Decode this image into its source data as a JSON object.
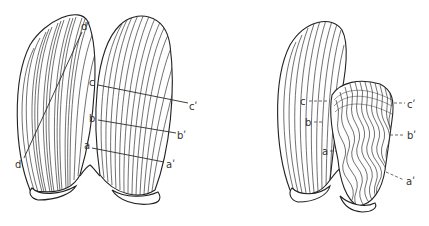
{
  "figure": {
    "left_panel": {
      "description": "Two intact fan-shaped structures with parallel radiating veins",
      "labels": {
        "d_prime": "dʹ",
        "d": "d",
        "c": "c",
        "c_prime": "cʹ",
        "b": "b",
        "b_prime": "bʹ",
        "a": "a",
        "a_prime": "aʹ"
      }
    },
    "right_panel": {
      "description": "Left structure intact, right structure contracted with wavy veins",
      "labels": {
        "c": "c",
        "c_prime": "cʹ",
        "b": "b",
        "b_prime": "bʹ",
        "a": "a",
        "a_prime": "aʹ"
      }
    },
    "colors": {
      "line": "#222222",
      "background": "#ffffff"
    }
  }
}
